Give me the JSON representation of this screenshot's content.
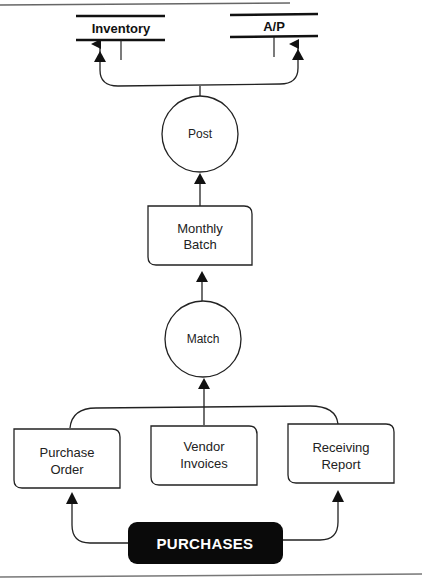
{
  "diagram": {
    "type": "data-flow-diagram",
    "data_stores": [
      {
        "id": "inventory",
        "label": "Inventory"
      },
      {
        "id": "ap",
        "label": "A/P"
      }
    ],
    "processes": [
      {
        "id": "post",
        "label": "Post"
      },
      {
        "id": "match",
        "label": "Match"
      }
    ],
    "documents": [
      {
        "id": "monthly_batch",
        "label_lines": [
          "Monthly",
          "Batch"
        ]
      },
      {
        "id": "purchase_order",
        "label_lines": [
          "Purchase",
          "Order"
        ]
      },
      {
        "id": "vendor_invoices",
        "label_lines": [
          "Vendor",
          "Invoices"
        ]
      },
      {
        "id": "receiving_report",
        "label_lines": [
          "Receiving",
          "Report"
        ]
      }
    ],
    "external_entity": {
      "id": "purchases",
      "label": "PURCHASES"
    },
    "flows": [
      {
        "from": "purchases",
        "to": "purchase_order"
      },
      {
        "from": "purchases",
        "to": "receiving_report"
      },
      {
        "from": "purchase_order",
        "to": "match"
      },
      {
        "from": "vendor_invoices",
        "to": "match"
      },
      {
        "from": "receiving_report",
        "to": "match"
      },
      {
        "from": "match",
        "to": "monthly_batch"
      },
      {
        "from": "monthly_batch",
        "to": "post"
      },
      {
        "from": "post",
        "to": "inventory"
      },
      {
        "from": "post",
        "to": "ap"
      }
    ]
  }
}
